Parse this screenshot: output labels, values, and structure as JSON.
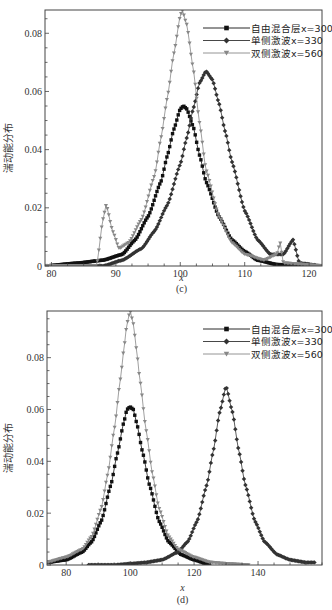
{
  "chart_data": [
    {
      "type": "line",
      "panel_label": "(c)",
      "title": "",
      "xlabel": "x",
      "ylabel": "湍动能分布",
      "xlim": [
        79,
        122
      ],
      "ylim": [
        0,
        0.088
      ],
      "xticks": [
        80,
        90,
        100,
        110,
        120
      ],
      "yticks": [
        0,
        0.02,
        0.04,
        0.06,
        0.08
      ],
      "ytick_labels": [
        "0",
        "0.02",
        "0.04",
        "0.06",
        "0.08"
      ],
      "grid": false,
      "legend_position": "upper right",
      "series": [
        {
          "name": "自由混合层x=300",
          "marker": "square",
          "color": "#111111",
          "x": [
            79,
            84,
            88,
            91,
            93,
            95,
            97,
            98,
            99,
            100,
            100.5,
            101,
            102,
            103,
            104,
            106,
            108,
            110,
            112,
            115,
            122
          ],
          "y": [
            0,
            0.001,
            0.002,
            0.004,
            0.009,
            0.017,
            0.029,
            0.038,
            0.047,
            0.054,
            0.055,
            0.054,
            0.048,
            0.038,
            0.029,
            0.017,
            0.009,
            0.005,
            0.002,
            0.0005,
            0
          ]
        },
        {
          "name": "单侧激波x=330",
          "marker": "diamond",
          "color": "#333333",
          "x": [
            79,
            88,
            91,
            94,
            96,
            98,
            100,
            101,
            102,
            103,
            104,
            105,
            106,
            107,
            108,
            110,
            112,
            114,
            116,
            117.5,
            118.5,
            122
          ],
          "y": [
            0,
            0,
            0.002,
            0.006,
            0.012,
            0.021,
            0.035,
            0.044,
            0.054,
            0.063,
            0.067,
            0.064,
            0.056,
            0.046,
            0.036,
            0.019,
            0.009,
            0.004,
            0.004,
            0.009,
            0.001,
            0
          ]
        },
        {
          "name": "双侧激波x=560",
          "marker": "triangle-down",
          "color": "#888888",
          "x": [
            79,
            87,
            88,
            88.5,
            89.5,
            90.5,
            92,
            94,
            96,
            97,
            98,
            99,
            100,
            100.3,
            101,
            102,
            103,
            104,
            106,
            108,
            110,
            113,
            115,
            115.5,
            116,
            122
          ],
          "y": [
            0,
            0,
            0.016,
            0.021,
            0.012,
            0.006,
            0.008,
            0.016,
            0.031,
            0.044,
            0.058,
            0.073,
            0.086,
            0.088,
            0.083,
            0.068,
            0.049,
            0.033,
            0.017,
            0.008,
            0.004,
            0.002,
            0.004,
            0.008,
            0.001,
            0
          ]
        }
      ]
    },
    {
      "type": "line",
      "panel_label": "(d)",
      "title": "",
      "xlabel": "x",
      "ylabel": "湍动能分布",
      "xlim": [
        74,
        160
      ],
      "ylim": [
        0,
        0.098
      ],
      "xticks": [
        80,
        100,
        120,
        140
      ],
      "yticks": [
        0,
        0.02,
        0.04,
        0.06,
        0.08
      ],
      "ytick_labels": [
        "0",
        "0.02",
        "0.04",
        "0.06",
        "0.08"
      ],
      "grid": false,
      "legend_position": "upper right",
      "series": [
        {
          "name": "自由混合层x=300",
          "marker": "square",
          "color": "#111111",
          "x": [
            74,
            80,
            85,
            88,
            91,
            94,
            96,
            98,
            99,
            100,
            101,
            102,
            104,
            106,
            109,
            112,
            116,
            120,
            125
          ],
          "y": [
            0.001,
            0.002,
            0.005,
            0.009,
            0.017,
            0.031,
            0.043,
            0.055,
            0.06,
            0.061,
            0.06,
            0.055,
            0.043,
            0.031,
            0.017,
            0.009,
            0.004,
            0.002,
            0
          ]
        },
        {
          "name": "单侧激波x=330",
          "marker": "diamond",
          "color": "#333333",
          "x": [
            87,
            95,
            100,
            105,
            110,
            115,
            118,
            121,
            124,
            126,
            128,
            130,
            132,
            134,
            136,
            139,
            142,
            146,
            150,
            155,
            158
          ],
          "y": [
            0,
            0,
            0.0005,
            0.001,
            0.002,
            0.005,
            0.009,
            0.017,
            0.031,
            0.044,
            0.059,
            0.069,
            0.059,
            0.044,
            0.031,
            0.017,
            0.009,
            0.004,
            0.002,
            0.001,
            0.001
          ]
        },
        {
          "name": "双侧激波x=560",
          "marker": "triangle-down",
          "color": "#888888",
          "x": [
            74,
            80,
            85,
            88,
            91,
            93,
            95,
            97,
            98,
            99,
            100,
            101,
            102,
            103,
            105,
            107,
            109,
            112,
            115,
            120,
            125,
            130,
            137
          ],
          "y": [
            0.001,
            0.003,
            0.006,
            0.011,
            0.022,
            0.035,
            0.052,
            0.072,
            0.083,
            0.093,
            0.098,
            0.093,
            0.083,
            0.072,
            0.052,
            0.035,
            0.022,
            0.011,
            0.006,
            0.003,
            0.001,
            0.0005,
            0
          ]
        }
      ]
    }
  ]
}
